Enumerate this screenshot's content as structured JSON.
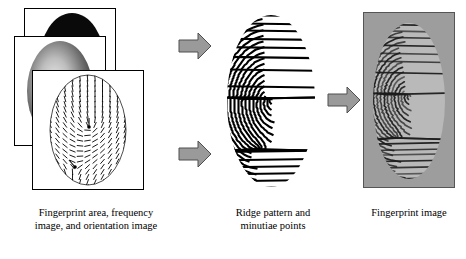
{
  "figure": {
    "title": "",
    "type": "fingerprint-synthesis-pipeline"
  },
  "stages": [
    {
      "id": "stage-1",
      "caption_lines": [
        "Fingerprint area, frequency",
        "image, and orientation image"
      ],
      "caption": "Fingerprint area, frequency image, and orientation image",
      "panels": [
        {
          "name": "fingerprint-area-panel",
          "content": "black-ellipse-mask"
        },
        {
          "name": "frequency-image-panel",
          "content": "grayscale-gradient-ellipse"
        },
        {
          "name": "orientation-image-panel",
          "content": "orientation-field-lines"
        }
      ],
      "minutiae_markers": 2
    },
    {
      "id": "stage-2",
      "caption_lines": [
        "Ridge pattern and",
        "minutiae points"
      ],
      "caption": "Ridge pattern and minutiae points",
      "panels": [
        {
          "name": "ridge-pattern-panel",
          "content": "binary-ridge-pattern"
        }
      ]
    },
    {
      "id": "stage-3",
      "caption_lines": [
        "Fingerprint image"
      ],
      "caption": "Fingerprint image",
      "panels": [
        {
          "name": "fingerprint-image-panel",
          "content": "grayscale-fingerprint-photo"
        }
      ]
    }
  ],
  "arrows": [
    {
      "name": "arrow-stage1-to-stage2-top",
      "direction": "right"
    },
    {
      "name": "arrow-stage1-to-stage2-bottom",
      "direction": "right"
    },
    {
      "name": "arrow-stage2-to-stage3",
      "direction": "right"
    }
  ],
  "colors": {
    "background": "#ffffff",
    "ink": "#000000",
    "arrow_fill": "#9a9a9a",
    "arrow_stroke": "#5a5a5a",
    "panel_border": "#000000"
  }
}
